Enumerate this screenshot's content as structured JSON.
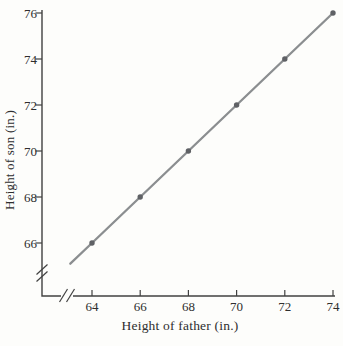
{
  "chart_data": {
    "type": "line",
    "title": "",
    "xlabel": "Height of father (in.)",
    "ylabel": "Height of son (in.)",
    "x": [
      64,
      66,
      68,
      70,
      72,
      74
    ],
    "y": [
      66,
      68,
      70,
      72,
      74,
      76
    ],
    "points": [
      [
        64,
        66
      ],
      [
        66,
        68
      ],
      [
        68,
        70
      ],
      [
        70,
        72
      ],
      [
        72,
        74
      ],
      [
        74,
        76
      ]
    ],
    "x_ticks": [
      64,
      66,
      68,
      70,
      72,
      74
    ],
    "y_ticks": [
      66,
      68,
      70,
      72,
      74,
      76
    ],
    "xlim": [
      63,
      74
    ],
    "ylim": [
      65,
      76
    ],
    "grid": false,
    "legend": false,
    "axis_break_x": true,
    "axis_break_y": true,
    "marker": "dot",
    "colors": {
      "line": "#8b8e90",
      "marker": "#5f6165",
      "axis": "#414141",
      "text": "#2e2e2e",
      "background": "#fdfdfb"
    }
  }
}
